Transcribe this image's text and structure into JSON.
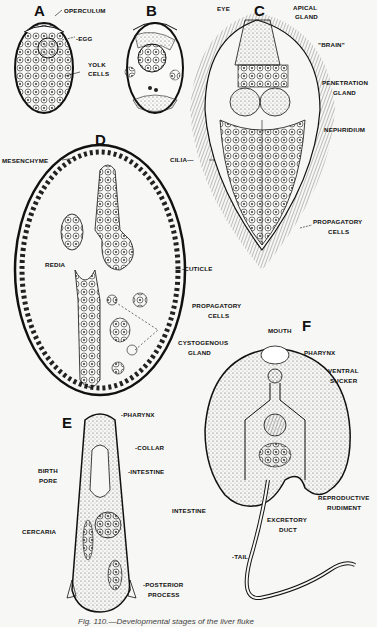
{
  "figure": {
    "caption": "Fig. 110.—Developmental stages of the liver fluke",
    "panels": [
      {
        "id": "A",
        "letter": "A",
        "title": "Egg",
        "labels": [
          "OPERCULUM",
          "EGG",
          "YOLK",
          "CELLS"
        ]
      },
      {
        "id": "B",
        "letter": "B",
        "title": "Developing egg",
        "labels": []
      },
      {
        "id": "C",
        "letter": "C",
        "title": "Miracidium",
        "labels": [
          "EYE",
          "APICAL",
          "GLAND",
          "\"BRAIN\"",
          "PENETRATION",
          "GLAND",
          "NEPHRIDIUM",
          "CILIA",
          "PROPAGATORY",
          "CELLS"
        ]
      },
      {
        "id": "D",
        "letter": "D",
        "title": "Sporocyst",
        "labels": [
          "MESENCHYME",
          "REDIA",
          "CUTICLE",
          "PROPAGATORY",
          "CELLS"
        ]
      },
      {
        "id": "E",
        "letter": "E",
        "title": "Redia",
        "labels": [
          "PHARYNX",
          "COLLAR",
          "INTESTINE",
          "BIRTH",
          "PORE",
          "CERCARIA",
          "POSTERIOR",
          "PROCESS"
        ]
      },
      {
        "id": "F",
        "letter": "F",
        "title": "Cercaria",
        "labels": [
          "MOUTH",
          "CYSTOGENOUS",
          "GLAND",
          "PHARYNX",
          "VENTRAL",
          "SUCKER",
          "INTESTINE",
          "REPRODUCTIVE",
          "RUDIMENT",
          "EXCRETORY",
          "DUCT",
          "TAIL"
        ]
      }
    ]
  },
  "labels": {
    "a_letter": "A",
    "a_operculum": "OPERCULUM",
    "a_egg": "-EGG",
    "a_yolk1": "YOLK",
    "a_yolk2": "CELLS",
    "b_letter": "B",
    "c_letter": "C",
    "c_eye": "EYE",
    "c_apical1": "APICAL",
    "c_apical2": "GLAND",
    "c_brain": "\"BRAIN\"",
    "c_pen1": "PENETRATION",
    "c_pen2": "GLAND",
    "c_neph": "NEPHRIDIUM",
    "c_cilia": "CILIA—",
    "c_prop1": "PROPAGATORY",
    "c_prop2": "CELLS",
    "d_letter": "D",
    "d_mes": "MESENCHYME",
    "d_redia": "REDIA",
    "d_cuticle": "-CUTICLE",
    "d_prop1": "PROPAGATORY",
    "d_prop2": "CELLS",
    "e_letter": "E",
    "e_pharynx": "-PHARYNX",
    "e_collar": "-COLLAR",
    "e_intestine": "-INTESTINE",
    "e_birth1": "BIRTH",
    "e_birth2": "PORE",
    "e_cercaria": "CERCARIA",
    "e_post1": "-POSTERIOR",
    "e_post2": "PROCESS",
    "f_letter": "F",
    "f_mouth": "MOUTH",
    "f_cyst1": "CYSTOGENOUS",
    "f_cyst2": "GLAND",
    "f_pharynx": "PHARYNX",
    "f_ventral1": "VENTRAL",
    "f_ventral2": "SUCKER",
    "f_intestine": "INTESTINE",
    "f_repro1": "REPRODUCTIVE",
    "f_repro2": "RUDIMENT",
    "f_exc1": "EXCRETORY",
    "f_exc2": "DUCT",
    "f_tail": "-TAIL"
  }
}
